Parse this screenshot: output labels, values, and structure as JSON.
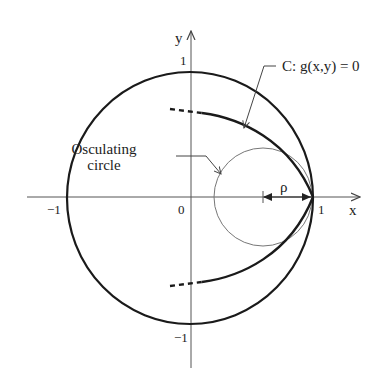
{
  "figure": {
    "axes": {
      "x_label": "x",
      "y_label": "y",
      "x_ticks": [
        {
          "label": "−1",
          "value": -1
        },
        {
          "label": "0",
          "value": 0
        },
        {
          "label": "1",
          "value": 1
        }
      ],
      "y_ticks": [
        {
          "label": "1",
          "value": 1
        },
        {
          "label": "−1",
          "value": -1
        }
      ]
    },
    "curve_label": "C: g(x,y) = 0",
    "osculating_label_line1": "Osculating",
    "osculating_label_line2": "circle",
    "radius_label": "ρ",
    "colors": {
      "unit_circle": "#1a1a1a",
      "curve": "#1a1a1a",
      "osculating_circle": "#777777",
      "axes": "#555555",
      "text": "#222222"
    }
  }
}
